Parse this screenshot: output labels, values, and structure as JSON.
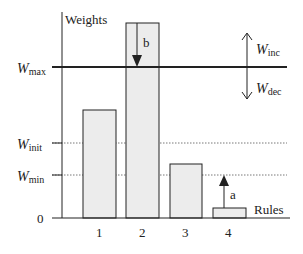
{
  "diagram": {
    "y_axis_label": "Weights",
    "x_axis_label": "Rules",
    "zero_label": "0",
    "levels": {
      "max": {
        "symbol": "W",
        "subscript": "max"
      },
      "init": {
        "symbol": "W",
        "subscript": "init"
      },
      "min": {
        "symbol": "W",
        "subscript": "min"
      }
    },
    "adjust": {
      "inc": {
        "symbol": "W",
        "subscript": "inc"
      },
      "dec": {
        "symbol": "W",
        "subscript": "dec"
      }
    },
    "bars": [
      {
        "label": "1"
      },
      {
        "label": "2",
        "annotation": "b"
      },
      {
        "label": "3"
      },
      {
        "label": "4",
        "annotation": "a"
      }
    ],
    "colors": {
      "bar_fill": "#ececec",
      "line": "#222222"
    }
  }
}
